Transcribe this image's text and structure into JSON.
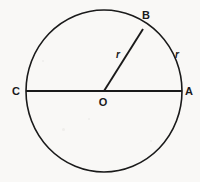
{
  "figure": {
    "type": "geometry-diagram",
    "background_color": "#f9f8f6",
    "stroke_color": "#1a1a1a",
    "geometry": {
      "circle": {
        "cx": 104,
        "cy": 91,
        "rx": 78,
        "ry": 81
      },
      "diameter": {
        "from": "C",
        "to": "A",
        "x1": 26,
        "y1": 91,
        "x2": 182,
        "y2": 91
      },
      "radius": {
        "from": "O",
        "to": "B",
        "x1": 104,
        "y1": 91,
        "x2": 143,
        "y2": 29
      }
    },
    "labels": [
      {
        "id": "label-b",
        "text": "B",
        "kind": "point",
        "x": 146,
        "y": 15
      },
      {
        "id": "label-r-inner",
        "text": "r",
        "kind": "measure",
        "x": 118,
        "y": 55
      },
      {
        "id": "label-r-outer",
        "text": "r",
        "kind": "measure",
        "x": 177,
        "y": 55
      },
      {
        "id": "label-c",
        "text": "C",
        "kind": "point",
        "x": 16,
        "y": 91
      },
      {
        "id": "label-o",
        "text": "O",
        "kind": "point",
        "x": 103,
        "y": 102
      },
      {
        "id": "label-a",
        "text": "A",
        "kind": "point",
        "x": 189,
        "y": 91
      }
    ]
  }
}
